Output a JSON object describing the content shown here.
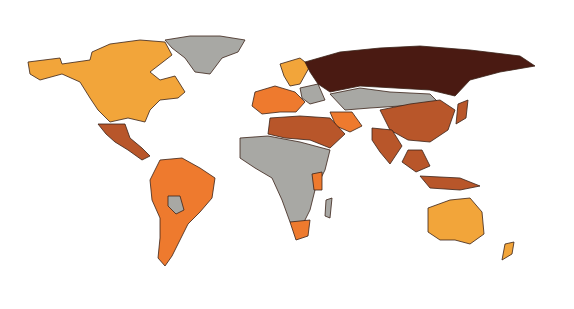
{
  "map": {
    "type": "choropleth",
    "projection": "world",
    "legend": null,
    "classes": [
      {
        "id": "c1",
        "color": "#F2A53A"
      },
      {
        "id": "c2",
        "color": "#EE7A2E"
      },
      {
        "id": "c3",
        "color": "#B8562A"
      },
      {
        "id": "c4",
        "color": "#4A1A12"
      },
      {
        "id": "nodata",
        "color": "#A8A8A4"
      }
    ],
    "regions": [
      {
        "name": "North America (Canada, USA, Alaska)",
        "class": "c1"
      },
      {
        "name": "Greenland",
        "class": "nodata"
      },
      {
        "name": "Mexico & Central America",
        "class": "c3"
      },
      {
        "name": "South America (Brazil, Argentina, etc.)",
        "class": "c2"
      },
      {
        "name": "Bolivia / Guyanas",
        "class": "nodata"
      },
      {
        "name": "Northern Europe (Scandinavia)",
        "class": "c1"
      },
      {
        "name": "Western/Southern Europe",
        "class": "c2"
      },
      {
        "name": "Eastern Europe",
        "class": "nodata"
      },
      {
        "name": "Russia",
        "class": "c4"
      },
      {
        "name": "Central Asia & Mongolia",
        "class": "nodata"
      },
      {
        "name": "China",
        "class": "c3"
      },
      {
        "name": "India",
        "class": "c3"
      },
      {
        "name": "Iran",
        "class": "c2"
      },
      {
        "name": "Middle East / North Africa",
        "class": "c3"
      },
      {
        "name": "Sub-Saharan Africa",
        "class": "nodata"
      },
      {
        "name": "Southern Africa (South Africa)",
        "class": "c2"
      },
      {
        "name": "East Africa (Tanzania, etc.)",
        "class": "c2"
      },
      {
        "name": "Japan",
        "class": "c3"
      },
      {
        "name": "Southeast Asia / Indonesia",
        "class": "c3"
      },
      {
        "name": "Australia",
        "class": "c1"
      },
      {
        "name": "New Zealand",
        "class": "c1"
      }
    ]
  }
}
